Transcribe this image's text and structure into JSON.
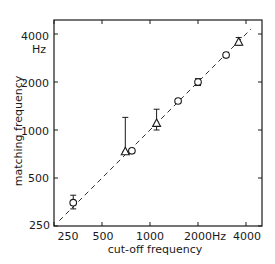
{
  "chart_data": {
    "type": "scatter",
    "title": "",
    "xlabel": "cut-off frequency",
    "ylabel": "matching frequency",
    "x_scale": "log",
    "y_scale": "log",
    "xlim": [
      250,
      4600
    ],
    "ylim": [
      250,
      4600
    ],
    "x_ticks": [
      250,
      500,
      1000,
      2000,
      4000
    ],
    "y_ticks": [
      250,
      500,
      1000,
      2000,
      4000
    ],
    "x_tick_labels": [
      "250",
      "500",
      "1000",
      "2000Hz",
      "4000"
    ],
    "y_tick_labels": [
      "250",
      "500",
      "1000",
      "2000",
      "4000"
    ],
    "y_unit_label": "Hz",
    "grid": false,
    "reference_line": {
      "style": "dashed",
      "description": "identity line (matching = cut-off)",
      "from": [
        270,
        270
      ],
      "to": [
        4300,
        4300
      ]
    },
    "series": [
      {
        "name": "circles",
        "marker": "circle",
        "points": [
          {
            "x": 330,
            "y": 350,
            "err_low": 320,
            "err_high": 390
          },
          {
            "x": 770,
            "y": 740,
            "err_low": 720,
            "err_high": 760
          },
          {
            "x": 1500,
            "y": 1520,
            "err_low": 1480,
            "err_high": 1560
          },
          {
            "x": 2000,
            "y": 2000,
            "err_low": 1900,
            "err_high": 2100
          },
          {
            "x": 3000,
            "y": 2950,
            "err_low": 2850,
            "err_high": 3050
          }
        ]
      },
      {
        "name": "triangles",
        "marker": "triangle",
        "points": [
          {
            "x": 700,
            "y": 730,
            "err_low": 730,
            "err_high": 1200
          },
          {
            "x": 1100,
            "y": 1100,
            "err_low": 1000,
            "err_high": 1350
          },
          {
            "x": 3600,
            "y": 3550,
            "err_low": 3400,
            "err_high": 3800
          }
        ]
      }
    ]
  },
  "labels": {
    "xlabel": "cut-off frequency",
    "ylabel": "matching frequency",
    "y_unit": "Hz",
    "x_ticks": [
      "250",
      "500",
      "1000",
      "2000Hz",
      "4000"
    ],
    "y_ticks": [
      "4000",
      "2000",
      "1000",
      "500",
      "250"
    ]
  },
  "colors": {
    "ink": "#1a1a1a",
    "background": "#ffffff"
  }
}
